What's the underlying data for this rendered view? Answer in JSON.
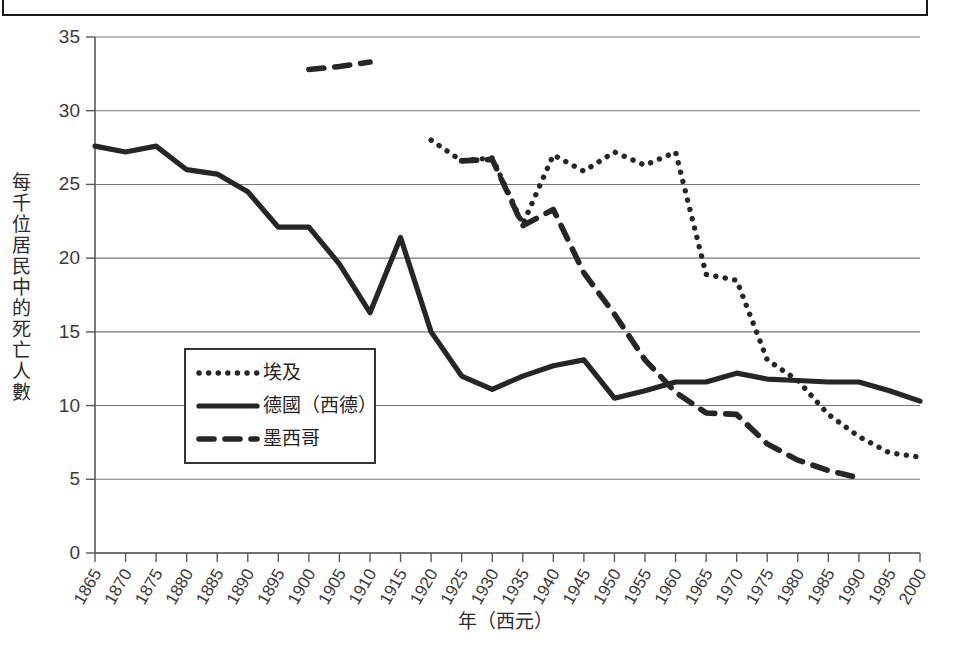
{
  "figure": {
    "frame_visible": true,
    "y_axis_title": "每千位居民中的死亡人數",
    "x_axis_title": "年（西元）"
  },
  "legend": {
    "position": "inside-left-lower",
    "items": [
      {
        "label": "埃及",
        "style": "dotted"
      },
      {
        "label": "德國（西德）",
        "style": "solid"
      },
      {
        "label": "墨西哥",
        "style": "dashed"
      }
    ]
  },
  "chart_data": {
    "type": "line",
    "title": "",
    "xlabel": "年（西元）",
    "ylabel": "每千位居民中的死亡人數",
    "xlim": [
      1865,
      2000
    ],
    "ylim": [
      0,
      35
    ],
    "ytick_step": 5,
    "grid": true,
    "yticks": [
      0,
      5,
      10,
      15,
      20,
      25,
      30,
      35
    ],
    "categories": [
      1865,
      1870,
      1875,
      1880,
      1885,
      1890,
      1895,
      1900,
      1905,
      1910,
      1915,
      1920,
      1925,
      1930,
      1935,
      1940,
      1945,
      1950,
      1955,
      1960,
      1965,
      1970,
      1975,
      1980,
      1985,
      1990,
      1995,
      2000
    ],
    "series": [
      {
        "name": "埃及",
        "style": "dotted",
        "color": "#262626",
        "x": [
          1920,
          1925,
          1930,
          1935,
          1940,
          1945,
          1950,
          1955,
          1960,
          1965,
          1970,
          1975,
          1980,
          1985,
          1990,
          1995,
          2000
        ],
        "values": [
          28.0,
          26.6,
          26.8,
          22.3,
          27.0,
          25.9,
          27.2,
          26.3,
          27.2,
          18.9,
          18.5,
          13.1,
          11.7,
          9.4,
          7.9,
          6.8,
          6.5
        ]
      },
      {
        "name": "德國（西德）",
        "style": "solid",
        "color": "#262626",
        "x": [
          1865,
          1870,
          1875,
          1880,
          1885,
          1890,
          1895,
          1900,
          1905,
          1910,
          1915,
          1920,
          1925,
          1930,
          1935,
          1940,
          1945,
          1950,
          1955,
          1960,
          1965,
          1970,
          1975,
          1980,
          1985,
          1990,
          1995,
          2000
        ],
        "values": [
          27.6,
          27.2,
          27.6,
          26.0,
          25.7,
          24.5,
          22.1,
          22.1,
          19.6,
          16.3,
          21.4,
          15.0,
          12.0,
          11.1,
          12.0,
          12.7,
          13.1,
          10.5,
          11.0,
          11.6,
          11.6,
          12.2,
          11.8,
          11.7,
          11.6,
          11.6,
          11.0,
          10.3
        ]
      },
      {
        "name": "墨西哥",
        "style": "dashed",
        "color": "#262626",
        "segments": [
          {
            "x": [
              1900,
              1905,
              1910
            ],
            "values": [
              32.8,
              33.0,
              33.3
            ]
          },
          {
            "x": [
              1925,
              1930,
              1935,
              1940,
              1945,
              1950,
              1955,
              1960,
              1965,
              1970,
              1975,
              1980,
              1985,
              1990
            ],
            "values": [
              26.6,
              26.7,
              22.2,
              23.3,
              19.0,
              16.2,
              13.1,
              10.9,
              9.5,
              9.4,
              7.4,
              6.3,
              5.6,
              5.1
            ]
          }
        ]
      }
    ]
  }
}
